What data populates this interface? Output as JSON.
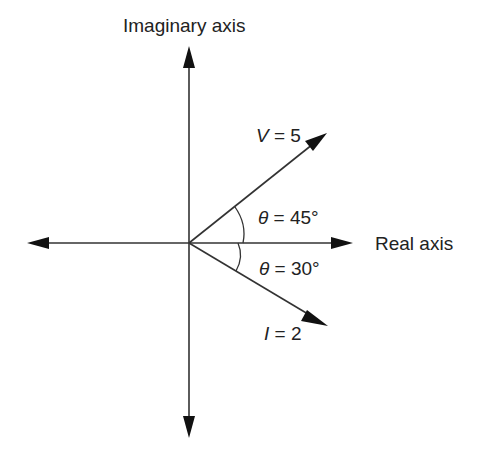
{
  "diagram": {
    "type": "phasor-diagram",
    "axes": {
      "imaginary_label": "Imaginary axis",
      "real_label": "Real axis"
    },
    "phasors": [
      {
        "name": "V",
        "label_var": "V",
        "label_eq": " = 5",
        "magnitude": 5,
        "angle_deg": 45,
        "angle_label_sym": "θ",
        "angle_label_val": " = 45°"
      },
      {
        "name": "I",
        "label_var": "I",
        "label_eq": " = 2",
        "magnitude": 2,
        "angle_deg": -30,
        "angle_label_sym": "θ",
        "angle_label_val": " = 30°"
      }
    ],
    "colors": {
      "line": "#222222",
      "background": "#ffffff"
    }
  }
}
